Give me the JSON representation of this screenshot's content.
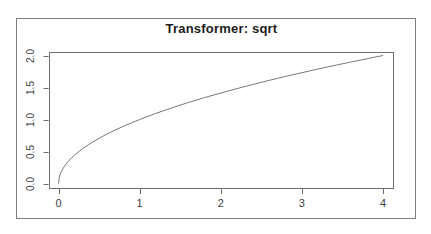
{
  "figure": {
    "title": "Transformer: sqrt"
  },
  "chart_data": {
    "type": "line",
    "title": "Transformer: sqrt",
    "subtitle": "",
    "xlabel": "",
    "ylabel": "",
    "function": "y = sqrt(x)",
    "xlim": [
      0,
      4
    ],
    "ylim": [
      0,
      2
    ],
    "grid": false,
    "legend": false,
    "x_ticks": {
      "values": [
        0,
        1,
        2,
        3,
        4
      ],
      "labels": [
        "0",
        "1",
        "2",
        "3",
        "4"
      ]
    },
    "y_ticks": {
      "values": [
        0,
        0.5,
        1,
        1.5,
        2
      ],
      "labels": [
        "0.0",
        "0.5",
        "1.0",
        "1.5",
        "2.0"
      ]
    },
    "series": [
      {
        "name": "sqrt",
        "points": [
          [
            0,
            0
          ],
          [
            0.01,
            0.1
          ],
          [
            0.03,
            0.173
          ],
          [
            0.05,
            0.224
          ],
          [
            0.08,
            0.283
          ],
          [
            0.12,
            0.346
          ],
          [
            0.16,
            0.4
          ],
          [
            0.2,
            0.447
          ],
          [
            0.3,
            0.548
          ],
          [
            0.4,
            0.632
          ],
          [
            0.5,
            0.707
          ],
          [
            0.6,
            0.775
          ],
          [
            0.7,
            0.837
          ],
          [
            0.8,
            0.894
          ],
          [
            0.9,
            0.949
          ],
          [
            1.0,
            1.0
          ],
          [
            1.2,
            1.095
          ],
          [
            1.4,
            1.183
          ],
          [
            1.6,
            1.265
          ],
          [
            1.8,
            1.342
          ],
          [
            2.0,
            1.414
          ],
          [
            2.2,
            1.483
          ],
          [
            2.4,
            1.549
          ],
          [
            2.6,
            1.612
          ],
          [
            2.8,
            1.673
          ],
          [
            3.0,
            1.732
          ],
          [
            3.2,
            1.789
          ],
          [
            3.4,
            1.844
          ],
          [
            3.6,
            1.897
          ],
          [
            3.8,
            1.949
          ],
          [
            4.0,
            2.0
          ]
        ]
      }
    ],
    "colors": {
      "line": "#787878",
      "plot_box": "#6e6e6e",
      "outer_border": "#7d7d7d",
      "tick": "#6e6e6e",
      "tick_label": "#404040",
      "title": "#1c1c1c"
    }
  }
}
